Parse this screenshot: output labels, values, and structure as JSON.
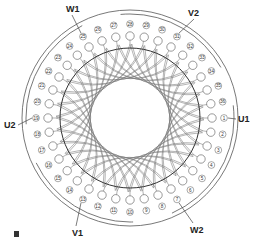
{
  "diagram": {
    "type": "stator-winding-diagram",
    "slot_count": 36,
    "center": [
      130,
      118
    ],
    "colors": {
      "line": "#444444",
      "coil": "#666666",
      "background": "#ffffff"
    },
    "slots": [
      "1",
      "2",
      "3",
      "4",
      "5",
      "6",
      "7",
      "8",
      "9",
      "10",
      "11",
      "12",
      "13",
      "14",
      "15",
      "16",
      "17",
      "18",
      "19",
      "20",
      "21",
      "22",
      "23",
      "24",
      "25",
      "26",
      "27",
      "28",
      "29",
      "30",
      "31",
      "32",
      "33",
      "34",
      "35",
      "36"
    ],
    "terminals": [
      {
        "id": "U1",
        "label": "U1",
        "slot": "1",
        "x": 238,
        "y": 122
      },
      {
        "id": "U2",
        "label": "U2",
        "slot": "19",
        "x": 4,
        "y": 128
      },
      {
        "id": "V1",
        "label": "V1",
        "slot": "13",
        "x": 72,
        "y": 236
      },
      {
        "id": "V2",
        "label": "V2",
        "slot": "31",
        "x": 188,
        "y": 16
      },
      {
        "id": "W1",
        "label": "W1",
        "slot": "25",
        "x": 66,
        "y": 12
      },
      {
        "id": "W2",
        "label": "W2",
        "slot": "7",
        "x": 190,
        "y": 233
      }
    ]
  }
}
